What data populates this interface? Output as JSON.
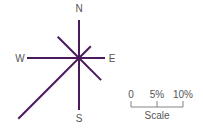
{
  "diagram": {
    "type": "wind-rose",
    "color": "#4a1a5c",
    "center": [
      79,
      58
    ],
    "px_per_percent": 5.2,
    "directions": [
      {
        "dir": "N",
        "angle": 0,
        "percent": 7.3
      },
      {
        "dir": "NE",
        "angle": 45,
        "percent": 3.2
      },
      {
        "dir": "E",
        "angle": 90,
        "percent": 5.0
      },
      {
        "dir": "SE",
        "angle": 135,
        "percent": 6.0
      },
      {
        "dir": "S",
        "angle": 180,
        "percent": 10.0
      },
      {
        "dir": "SW",
        "angle": 225,
        "percent": 16.5
      },
      {
        "dir": "W",
        "angle": 270,
        "percent": 10.0
      },
      {
        "dir": "NW",
        "angle": 315,
        "percent": 5.8
      }
    ],
    "labels": {
      "N": "N",
      "E": "E",
      "S": "S",
      "W": "W"
    }
  },
  "scale": {
    "ticks": [
      "0",
      "5%",
      "10%"
    ],
    "title": "Scale"
  }
}
